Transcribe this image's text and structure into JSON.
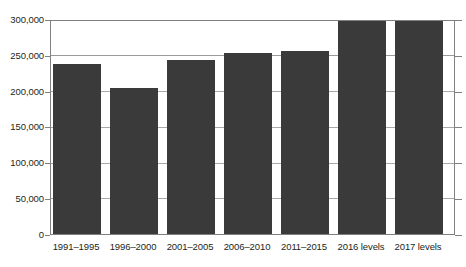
{
  "chart_data": {
    "type": "bar",
    "title": "",
    "subtitle": "",
    "xlabel": "",
    "ylabel": "",
    "categories": [
      "1991–1995",
      "1996–2000",
      "2001–2005",
      "2006–2010",
      "2011–2015",
      "2016 levels",
      "2017 levels"
    ],
    "values": [
      239000,
      205000,
      245000,
      255000,
      258000,
      300000,
      300000
    ],
    "ylim": [
      0,
      300000
    ],
    "y_ticks": [
      0,
      50000,
      100000,
      150000,
      200000,
      250000,
      300000
    ],
    "y_tick_labels": [
      "0",
      "50,000",
      "100,000",
      "150,000",
      "200,000",
      "250,000",
      "300,000"
    ],
    "grid": "horizontal",
    "legend": "none",
    "bar_color": "#3a3a3a",
    "axis_color": "#808080",
    "gridline_color": "#9a9a9a",
    "background": "#ffffff"
  }
}
